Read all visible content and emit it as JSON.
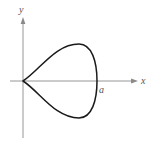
{
  "figure": {
    "type": "diagram",
    "axes": {
      "x_label": "x",
      "y_label": "y"
    },
    "annotations": [
      {
        "text": "a",
        "position": "right intercept on x-axis"
      }
    ],
    "colors": {
      "curve": "#1a1a1a",
      "axes": "#8a8a8a",
      "labels": "#555555",
      "background": "#ffffff"
    }
  }
}
